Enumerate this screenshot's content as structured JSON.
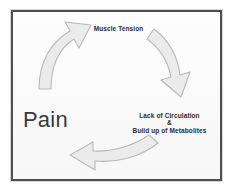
{
  "diagram": {
    "title_text": "Pain",
    "type": "pain-cycle-diagram",
    "frame": {
      "border_color": "#4f4f4f",
      "background_color": "#fbfbfb"
    },
    "labels": {
      "top": "Muscle Tension",
      "left": "Pain",
      "right_line1": "Lack of Circulation",
      "right_line2": "&",
      "right_line3": "Build up of Metabolites"
    },
    "arrows": [
      {
        "name": "arrow-pain-to-muscle-tension",
        "direction": "up-right",
        "fill": "#ebebeb",
        "stroke": "#b9b9b9"
      },
      {
        "name": "arrow-muscle-tension-to-circulation",
        "direction": "down",
        "fill": "#ebebeb",
        "stroke": "#b9b9b9"
      },
      {
        "name": "arrow-circulation-to-pain",
        "direction": "left",
        "fill": "#ebebeb",
        "stroke": "#b9b9b9"
      }
    ]
  }
}
